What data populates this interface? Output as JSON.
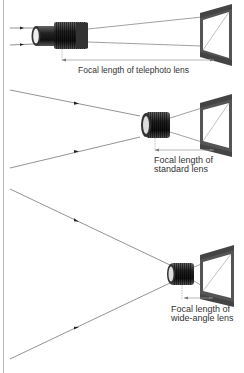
{
  "diagram": {
    "type": "lens-focal-length-comparison",
    "colors": {
      "ray": "#777777",
      "lens_dark": "#2a2a2a",
      "lens_mid": "#555555",
      "lens_light": "#cccccc",
      "film_frame": "#555555",
      "film_bg": "#ffffff",
      "dimension_line": "#999999",
      "text": "#333333",
      "border": "#bbbbbb"
    },
    "panels": [
      {
        "id": "telephoto",
        "label": "Focal length of telephoto lens",
        "label_lines": [
          "Focal length of telephoto lens"
        ]
      },
      {
        "id": "standard",
        "label": "Focal length of standard lens",
        "label_lines": [
          "Focal length of",
          "standard lens"
        ]
      },
      {
        "id": "wide-angle",
        "label": "Focal length of wide-angle lens",
        "label_lines": [
          "Focal length of",
          "wide-angle lens"
        ]
      }
    ]
  }
}
